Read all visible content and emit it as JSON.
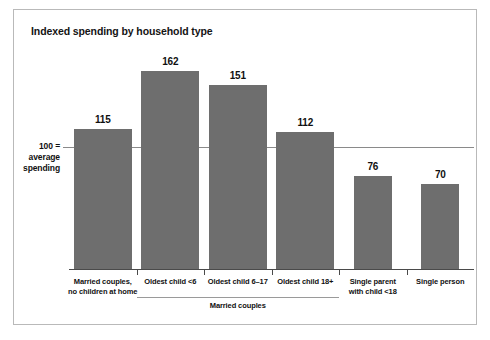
{
  "figure": {
    "title": "Indexed spending by household type",
    "border_color": "#b9b9b9",
    "background": "#ffffff"
  },
  "axis": {
    "reference_label_line1": "100 =",
    "reference_label_line2": "average",
    "reference_label_line3": "spending",
    "reference_value": 100,
    "baseline_value": 0,
    "axis_color": "#4a4a4a",
    "reference_line_color": "#8a8a8a"
  },
  "group": {
    "label": "Married couples",
    "covers_categories": [
      "Oldest child <6",
      "Oldest child 6–17",
      "Oldest child 18+"
    ]
  },
  "chart_data": {
    "type": "bar",
    "title": "Indexed spending by household type",
    "xlabel": "",
    "ylabel": "100 = average spending",
    "categories": [
      "Married couples,\nno children at home",
      "Oldest child <6",
      "Oldest child 6–17",
      "Oldest child 18+",
      "Single parent\nwith child <18",
      "Single person"
    ],
    "category_lines": [
      [
        "Married couples,",
        "no children at home"
      ],
      [
        "Oldest child <6",
        ""
      ],
      [
        "Oldest child 6–17",
        ""
      ],
      [
        "Oldest child 18+",
        ""
      ],
      [
        "Single parent",
        "with child <18"
      ],
      [
        "Single person",
        ""
      ]
    ],
    "values": [
      115,
      162,
      151,
      112,
      76,
      70
    ],
    "value_labels": [
      "115",
      "162",
      "151",
      "112",
      "76",
      "70"
    ],
    "bar_color": "#6e6e6e",
    "ylim": [
      0,
      175
    ],
    "reference_line": 100,
    "grid": false,
    "legend": "none"
  }
}
